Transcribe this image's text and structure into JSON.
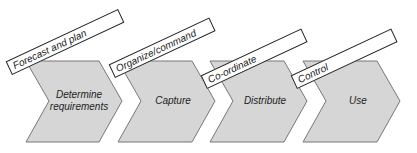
{
  "diagram": {
    "stages": [
      {
        "label_line1": "Determine",
        "label_line2": "requirements"
      },
      {
        "label_line1": "Capture",
        "label_line2": ""
      },
      {
        "label_line1": "Distribute",
        "label_line2": ""
      },
      {
        "label_line1": "Use",
        "label_line2": ""
      }
    ],
    "tags": [
      {
        "label": "Forecast and plan"
      },
      {
        "label": "Organize/command"
      },
      {
        "label": "Co-ordinate"
      },
      {
        "label": "Control"
      }
    ],
    "colors": {
      "chevron_fill": "#d6d6d6",
      "stroke": "#555555",
      "tag_fill": "#ffffff"
    }
  }
}
